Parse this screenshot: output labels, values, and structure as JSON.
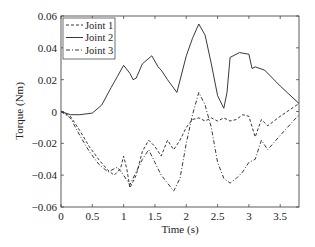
{
  "chart_data": {
    "type": "line",
    "title": "",
    "xlabel": "Time (s)",
    "ylabel": "Torque (Nm)",
    "xlim": [
      0,
      3.8
    ],
    "ylim": [
      -0.06,
      0.06
    ],
    "xticks": [
      0,
      0.5,
      1,
      1.5,
      2,
      2.5,
      3,
      3.5
    ],
    "xtick_labels": [
      "0",
      "0.5",
      "1",
      "1.5",
      "2",
      "2.5",
      "3",
      "3.5"
    ],
    "yticks": [
      -0.06,
      -0.04,
      -0.02,
      0,
      0.02,
      0.04,
      0.06
    ],
    "ytick_labels": [
      "-0.06",
      "-0.04",
      "-0.02",
      "0",
      "0.02",
      "0.04",
      "0.06"
    ],
    "grid": false,
    "legend_position": "upper left",
    "series": [
      {
        "name": "Joint 1",
        "style": "dashed",
        "color": "#222222",
        "x": [
          0,
          0.15,
          0.3,
          0.45,
          0.6,
          0.75,
          0.85,
          0.95,
          1.0,
          1.05,
          1.1,
          1.2,
          1.3,
          1.4,
          1.5,
          1.6,
          1.7,
          1.8,
          1.9,
          2.0,
          2.1,
          2.2,
          2.3,
          2.4,
          2.5,
          2.6,
          2.7,
          2.8,
          2.9,
          3.0,
          3.1,
          3.2,
          3.3,
          3.5,
          3.8
        ],
        "y": [
          0,
          -0.003,
          -0.012,
          -0.022,
          -0.03,
          -0.037,
          -0.04,
          -0.036,
          -0.028,
          -0.036,
          -0.048,
          -0.04,
          -0.025,
          -0.018,
          -0.022,
          -0.028,
          -0.018,
          -0.024,
          -0.018,
          -0.01,
          -0.005,
          -0.004,
          -0.006,
          -0.004,
          -0.006,
          -0.004,
          -0.006,
          -0.005,
          -0.002,
          -0.003,
          -0.016,
          -0.005,
          -0.009,
          -0.003,
          0.005
        ]
      },
      {
        "name": "Joint 2",
        "style": "solid",
        "color": "#222222",
        "x": [
          0,
          0.15,
          0.3,
          0.5,
          0.65,
          0.8,
          0.9,
          1.0,
          1.1,
          1.15,
          1.2,
          1.3,
          1.45,
          1.55,
          1.6,
          1.7,
          1.85,
          2.0,
          2.1,
          2.2,
          2.3,
          2.4,
          2.5,
          2.6,
          2.65,
          2.7,
          2.85,
          3.0,
          3.05,
          3.1,
          3.25,
          3.5,
          3.8
        ],
        "y": [
          0,
          -0.002,
          -0.002,
          -0.001,
          0.004,
          0.015,
          0.022,
          0.029,
          0.024,
          0.02,
          0.021,
          0.03,
          0.035,
          0.028,
          0.026,
          0.02,
          0.012,
          0.035,
          0.046,
          0.055,
          0.048,
          0.03,
          0.01,
          0.002,
          0.012,
          0.034,
          0.037,
          0.036,
          0.027,
          0.028,
          0.026,
          0.016,
          0.005
        ]
      },
      {
        "name": "Joint 3",
        "style": "dash-dot",
        "color": "#222222",
        "x": [
          0,
          0.15,
          0.3,
          0.45,
          0.6,
          0.75,
          0.9,
          1.0,
          1.1,
          1.2,
          1.3,
          1.4,
          1.5,
          1.6,
          1.7,
          1.8,
          1.9,
          2.0,
          2.1,
          2.2,
          2.3,
          2.4,
          2.5,
          2.6,
          2.7,
          2.8,
          2.9,
          3.0,
          3.1,
          3.2,
          3.3,
          3.5,
          3.8
        ],
        "y": [
          0,
          -0.004,
          -0.015,
          -0.025,
          -0.033,
          -0.038,
          -0.035,
          -0.04,
          -0.046,
          -0.038,
          -0.03,
          -0.024,
          -0.032,
          -0.04,
          -0.045,
          -0.05,
          -0.042,
          -0.02,
          -0.002,
          0.012,
          0.004,
          -0.01,
          -0.032,
          -0.042,
          -0.045,
          -0.042,
          -0.038,
          -0.032,
          -0.03,
          -0.018,
          -0.024,
          -0.015,
          -0.002
        ]
      }
    ]
  }
}
